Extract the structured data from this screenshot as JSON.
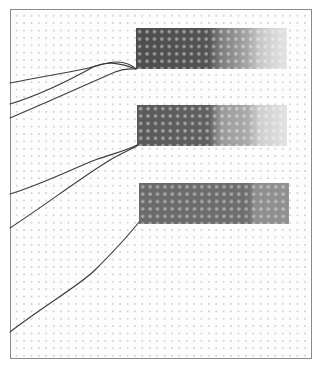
{
  "figure": {
    "bands": [
      {
        "id": 1,
        "gradient": [
          "#4d4d4d",
          "#545454",
          "#7d7d7d",
          "#a6a6a6",
          "#c8c8c8",
          "#e4e4e4"
        ]
      },
      {
        "id": 2,
        "gradient": [
          "#5a5a5a",
          "#606060",
          "#9a9a9a",
          "#ababab",
          "#cfcfcf",
          "#e2e2e2"
        ]
      },
      {
        "id": 3,
        "gradient": [
          "#6a6a6a",
          "#6e6e6e",
          "#747474",
          "#8e8e8e",
          "#909090"
        ]
      }
    ],
    "threads_per_band": [
      3,
      2,
      1
    ],
    "colors": {
      "background": "#ffffff",
      "frame_border": "#8a8a8a",
      "grid_dots": "#d6d6d6",
      "thread": "#3c3c3c"
    }
  }
}
